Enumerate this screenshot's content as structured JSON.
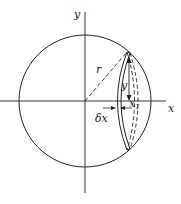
{
  "diagram": {
    "labels": {
      "y_axis": "y",
      "x_axis": "x",
      "radius": "r",
      "ordinate": "y",
      "abscissa": "x",
      "abscissa_sub": "1",
      "thickness": "δx"
    },
    "colors": {
      "stroke": "#222222",
      "background": "#ffffff"
    }
  }
}
